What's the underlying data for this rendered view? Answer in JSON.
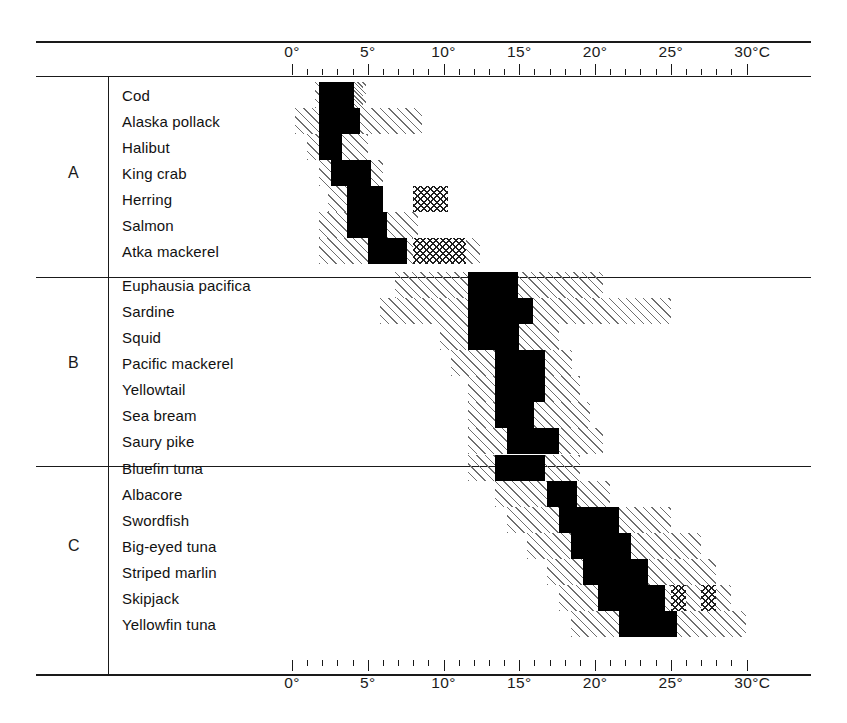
{
  "chart_data": {
    "type": "bar",
    "title": "",
    "xlabel": "Temperature (°C)",
    "ylabel": "",
    "xlim": [
      -1,
      31.5
    ],
    "xtick_step_major": 5,
    "xtick_step_minor": 1,
    "grid": false,
    "legend_position": "none",
    "axis_unit_label": "°C",
    "tick_labels_top": [
      "0°",
      "5°",
      "10°",
      "15°",
      "20°",
      "25°",
      "30°C"
    ],
    "tick_labels_bottom": [
      "0°",
      "5°",
      "10°",
      "15°",
      "20°",
      "25°",
      "30°C"
    ],
    "tick_values": [
      0,
      5,
      10,
      15,
      20,
      25,
      30
    ],
    "band_kinds": {
      "solid": "optimum / principal temperature range",
      "hatch": "occurrence range",
      "xhatch": "secondary range"
    },
    "groups": [
      {
        "label": "A",
        "species": [
          {
            "name": "Cod",
            "bands": [
              {
                "kind": "hatch",
                "start": 1.5,
                "end": 4.7
              },
              {
                "kind": "solid",
                "start": 1.8,
                "end": 4.1
              },
              {
                "kind": "hatch",
                "start": 4.1,
                "end": 4.9
              }
            ]
          },
          {
            "name": "Alaska pollack",
            "bands": [
              {
                "kind": "hatch",
                "start": 0.2,
                "end": 8.6
              },
              {
                "kind": "solid",
                "start": 1.8,
                "end": 4.5
              }
            ]
          },
          {
            "name": "Halibut",
            "bands": [
              {
                "kind": "hatch",
                "start": 1.0,
                "end": 5.0
              },
              {
                "kind": "solid",
                "start": 1.8,
                "end": 3.3
              }
            ]
          },
          {
            "name": "King crab",
            "bands": [
              {
                "kind": "hatch",
                "start": 1.8,
                "end": 6.0
              },
              {
                "kind": "solid",
                "start": 2.6,
                "end": 5.2
              }
            ]
          },
          {
            "name": "Herring",
            "bands": [
              {
                "kind": "hatch",
                "start": 2.4,
                "end": 6.0
              },
              {
                "kind": "solid",
                "start": 3.6,
                "end": 6.0
              },
              {
                "kind": "xhatch",
                "start": 8.0,
                "end": 10.3
              }
            ]
          },
          {
            "name": "Salmon",
            "bands": [
              {
                "kind": "hatch",
                "start": 1.8,
                "end": 8.3
              },
              {
                "kind": "solid",
                "start": 3.6,
                "end": 6.3
              }
            ]
          },
          {
            "name": "Atka mackerel",
            "bands": [
              {
                "kind": "hatch",
                "start": 1.8,
                "end": 12.4
              },
              {
                "kind": "solid",
                "start": 5.0,
                "end": 7.6
              },
              {
                "kind": "xhatch",
                "start": 8.0,
                "end": 11.5
              }
            ]
          }
        ]
      },
      {
        "label": "B",
        "species": [
          {
            "name": "Euphausia pacifica",
            "bands": [
              {
                "kind": "hatch",
                "start": 6.8,
                "end": 20.5
              },
              {
                "kind": "solid",
                "start": 11.6,
                "end": 14.9
              }
            ]
          },
          {
            "name": "Sardine",
            "bands": [
              {
                "kind": "hatch",
                "start": 5.8,
                "end": 25.0
              },
              {
                "kind": "solid",
                "start": 11.6,
                "end": 15.9
              }
            ]
          },
          {
            "name": "Squid",
            "bands": [
              {
                "kind": "hatch",
                "start": 9.8,
                "end": 17.6
              },
              {
                "kind": "solid",
                "start": 11.6,
                "end": 15.0
              }
            ]
          },
          {
            "name": "Pacific mackerel",
            "bands": [
              {
                "kind": "hatch",
                "start": 10.5,
                "end": 18.5
              },
              {
                "kind": "solid",
                "start": 13.4,
                "end": 16.7
              }
            ]
          },
          {
            "name": "Yellowtail",
            "bands": [
              {
                "kind": "hatch",
                "start": 11.6,
                "end": 19.0
              },
              {
                "kind": "solid",
                "start": 13.4,
                "end": 16.7
              }
            ]
          },
          {
            "name": "Sea bream",
            "bands": [
              {
                "kind": "hatch",
                "start": 11.6,
                "end": 19.7
              },
              {
                "kind": "solid",
                "start": 13.4,
                "end": 16.0
              }
            ]
          },
          {
            "name": "Saury pike",
            "bands": [
              {
                "kind": "hatch",
                "start": 11.6,
                "end": 20.5
              },
              {
                "kind": "solid",
                "start": 14.2,
                "end": 17.6
              }
            ]
          }
        ]
      },
      {
        "label": "C",
        "species": [
          {
            "name": "Bluefin tuna",
            "bands": [
              {
                "kind": "hatch",
                "start": 11.6,
                "end": 19.0
              },
              {
                "kind": "solid",
                "start": 13.4,
                "end": 16.7
              }
            ]
          },
          {
            "name": "Albacore",
            "bands": [
              {
                "kind": "hatch",
                "start": 13.4,
                "end": 21.0
              },
              {
                "kind": "solid",
                "start": 16.8,
                "end": 18.8
              }
            ]
          },
          {
            "name": "Swordfish",
            "bands": [
              {
                "kind": "hatch",
                "start": 14.2,
                "end": 25.0
              },
              {
                "kind": "solid",
                "start": 17.6,
                "end": 21.6
              }
            ]
          },
          {
            "name": "Big-eyed tuna",
            "bands": [
              {
                "kind": "hatch",
                "start": 15.5,
                "end": 27.0
              },
              {
                "kind": "solid",
                "start": 18.4,
                "end": 22.4
              }
            ]
          },
          {
            "name": "Striped marlin",
            "bands": [
              {
                "kind": "hatch",
                "start": 16.8,
                "end": 28.0
              },
              {
                "kind": "solid",
                "start": 19.2,
                "end": 23.5
              }
            ]
          },
          {
            "name": "Skipjack",
            "bands": [
              {
                "kind": "hatch",
                "start": 17.6,
                "end": 29.0
              },
              {
                "kind": "solid",
                "start": 20.2,
                "end": 24.6
              },
              {
                "kind": "xhatch",
                "start": 25.0,
                "end": 26.0
              },
              {
                "kind": "xhatch",
                "start": 27.0,
                "end": 28.0
              }
            ]
          },
          {
            "name": "Yellowfin tuna",
            "bands": [
              {
                "kind": "hatch",
                "start": 18.4,
                "end": 30.0
              },
              {
                "kind": "solid",
                "start": 21.6,
                "end": 25.4
              }
            ]
          }
        ]
      }
    ]
  }
}
